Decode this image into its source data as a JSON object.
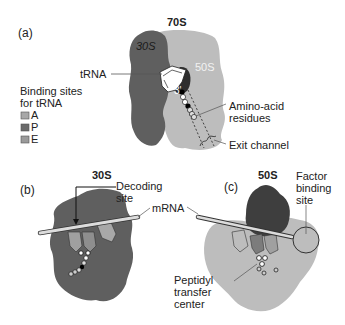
{
  "panels": {
    "a": {
      "label": "(a)",
      "title": "70S",
      "subunit_small": "30S",
      "subunit_large": "50S",
      "trna_label": "tRNA",
      "three_prime": "3'",
      "amino_acid_label_1": "Amino-acid",
      "amino_acid_label_2": "residues",
      "exit_channel_label": "Exit channel",
      "legend": {
        "title_1": "Binding sites",
        "title_2": "for tRNA",
        "items": [
          {
            "label": "A",
            "color": "#a8a8a8"
          },
          {
            "label": "P",
            "color": "#6a6a6a"
          },
          {
            "label": "E",
            "color": "#9a9a9a"
          }
        ]
      }
    },
    "b": {
      "label": "(b)",
      "title": "30S",
      "decoding_1": "Decoding",
      "decoding_2": "site",
      "mrna_label": "mRNA"
    },
    "c": {
      "label": "(c)",
      "title": "50S",
      "factor_1": "Factor",
      "factor_2": "binding",
      "factor_3": "site",
      "peptidyl_1": "Peptidyl",
      "peptidyl_2": "transfer",
      "peptidyl_3": "center"
    }
  },
  "colors": {
    "small_subunit": "#5f5f5f",
    "large_subunit": "#bdbdbd",
    "dark_50s": "#3e3e3e",
    "trna_white": "#ffffff",
    "mrna": "#d8d8d8"
  }
}
